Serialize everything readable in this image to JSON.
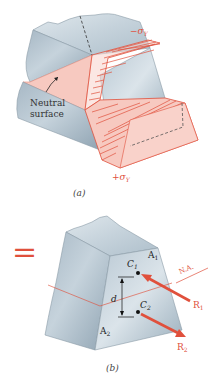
{
  "figure_a": {
    "caption": "(a)",
    "neutral_surface_label_line1": "Neutral",
    "neutral_surface_label_line2": "surface",
    "stress_top_label": "−σY",
    "stress_bottom_label": "+σY",
    "stress_top_sign": "−σ",
    "stress_top_sub": "Y",
    "stress_bottom_sign": "+σ",
    "stress_bottom_sub": "Y"
  },
  "equals_sign": "=",
  "figure_b": {
    "caption": "(b)",
    "area_top_label": "A",
    "area_top_sub": "1",
    "area_bottom_label": "A",
    "area_bottom_sub": "2",
    "centroid_top_label": "C",
    "centroid_top_sub": "1",
    "centroid_bottom_label": "C",
    "centroid_bottom_sub": "2",
    "distance_label": "d",
    "neutral_axis_label": "N.A.",
    "resultant_top_label": "R",
    "resultant_top_sub": "1",
    "resultant_bottom_label": "R",
    "resultant_bottom_sub": "2"
  },
  "colors": {
    "accent_red": "#e0503c",
    "stress_pink": "#f7c9c0",
    "steel_light": "#c9d6df",
    "steel_mid": "#9fb1bf",
    "steel_dark": "#7d919f"
  }
}
